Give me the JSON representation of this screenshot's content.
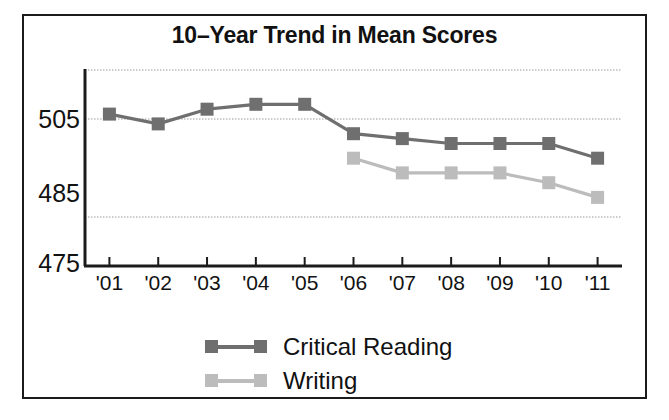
{
  "figure": {
    "title": "10–Year Trend in Mean Scores",
    "frame_color": "#1b1b1b",
    "background": "#ffffff"
  },
  "chart_data": {
    "type": "line",
    "title": "10–Year Trend in Mean Scores",
    "xlabel": "",
    "ylabel": "",
    "categories": [
      "'01",
      "'02",
      "'03",
      "'04",
      "'05",
      "'06",
      "'07",
      "'08",
      "'09",
      "'10",
      "'11"
    ],
    "ylim": [
      475,
      515
    ],
    "yticks": [
      475,
      485,
      505
    ],
    "ytick_labels": [
      "475",
      "485",
      "505"
    ],
    "gridlines": [
      515,
      505,
      485
    ],
    "grid": true,
    "legend_position": "bottom-center",
    "series": [
      {
        "name": "Critical Reading",
        "color": "#6f6f6f",
        "marker": "square",
        "values": [
          506,
          504,
          507,
          508,
          508,
          502,
          501,
          500,
          500,
          500,
          497
        ]
      },
      {
        "name": "Writing",
        "color": "#bcbcbc",
        "marker": "square",
        "values": [
          null,
          null,
          null,
          null,
          null,
          497,
          494,
          494,
          494,
          492,
          489
        ]
      }
    ]
  },
  "legend": {
    "items": [
      {
        "label": "Critical Reading",
        "color": "#6f6f6f"
      },
      {
        "label": "Writing",
        "color": "#bcbcbc"
      }
    ]
  },
  "axis": {
    "y_tick_labels": [
      "505",
      "485",
      "475"
    ],
    "x_tick_labels": [
      "'01",
      "'02",
      "'03",
      "'04",
      "'05",
      "'06",
      "'07",
      "'08",
      "'09",
      "'10",
      "'11"
    ],
    "axis_color": "#1b1b1b",
    "grid_color": "#9a9a9a"
  }
}
